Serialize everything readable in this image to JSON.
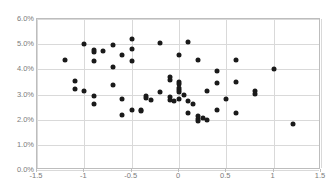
{
  "chart_data": {
    "type": "scatter",
    "title": "",
    "xlabel": "",
    "ylabel": "",
    "xlim": [
      -1.5,
      1.5
    ],
    "ylim": [
      0.0,
      6.0
    ],
    "xticks": [
      "-1.5",
      "-1",
      "-0.5",
      "0",
      "0.5",
      "1",
      "1.5"
    ],
    "xtick_values": [
      -1.5,
      -1,
      -0.5,
      0,
      0.5,
      1,
      1.5
    ],
    "yticks": [
      "0.0%",
      "1.0%",
      "2.0%",
      "3.0%",
      "4.0%",
      "5.0%",
      "6.0%"
    ],
    "ytick_values": [
      0,
      1,
      2,
      3,
      4,
      5,
      6
    ],
    "grid": true,
    "legend": false,
    "marker_color": "#1a1a1a",
    "grid_color": "#d9d9d9",
    "axis_color": "#bdbdbd",
    "tick_label_color": "#7b7b7b",
    "series": [
      {
        "name": "observations",
        "points": [
          [
            -1.2,
            4.38
          ],
          [
            -1.1,
            3.52
          ],
          [
            -1.1,
            3.2
          ],
          [
            -1.0,
            5.0
          ],
          [
            -1.0,
            3.14
          ],
          [
            -0.9,
            4.78
          ],
          [
            -0.9,
            4.7
          ],
          [
            -0.9,
            4.34
          ],
          [
            -0.9,
            2.96
          ],
          [
            -0.9,
            2.62
          ],
          [
            -0.8,
            4.72
          ],
          [
            -0.7,
            4.95
          ],
          [
            -0.7,
            4.09
          ],
          [
            -0.7,
            3.38
          ],
          [
            -0.6,
            4.55
          ],
          [
            -0.6,
            2.84
          ],
          [
            -0.6,
            2.18
          ],
          [
            -0.5,
            5.22
          ],
          [
            -0.5,
            4.8
          ],
          [
            -0.5,
            4.34
          ],
          [
            -0.5,
            2.38
          ],
          [
            -0.4,
            2.4
          ],
          [
            -0.4,
            2.33
          ],
          [
            -0.35,
            2.95
          ],
          [
            -0.35,
            2.86
          ],
          [
            -0.3,
            2.79
          ],
          [
            -0.2,
            5.06
          ],
          [
            -0.2,
            3.08
          ],
          [
            -0.1,
            3.7
          ],
          [
            -0.1,
            3.56
          ],
          [
            -0.1,
            2.92
          ],
          [
            -0.1,
            2.8
          ],
          [
            -0.05,
            2.74
          ],
          [
            0.0,
            4.57
          ],
          [
            0.0,
            3.5
          ],
          [
            0.0,
            3.4
          ],
          [
            0.0,
            3.26
          ],
          [
            0.0,
            3.18
          ],
          [
            0.0,
            3.1
          ],
          [
            0.0,
            2.81
          ],
          [
            0.05,
            3.0
          ],
          [
            0.1,
            5.1
          ],
          [
            0.1,
            2.73
          ],
          [
            0.1,
            2.26
          ],
          [
            0.15,
            2.62
          ],
          [
            0.2,
            4.36
          ],
          [
            0.2,
            2.16
          ],
          [
            0.2,
            2.02
          ],
          [
            0.2,
            1.93
          ],
          [
            0.25,
            2.05
          ],
          [
            0.3,
            3.13
          ],
          [
            0.3,
            2.0
          ],
          [
            0.4,
            3.95
          ],
          [
            0.4,
            3.44
          ],
          [
            0.4,
            2.4
          ],
          [
            0.5,
            2.81
          ],
          [
            0.6,
            4.39
          ],
          [
            0.6,
            3.48
          ],
          [
            0.6,
            2.26
          ],
          [
            0.8,
            3.12
          ],
          [
            0.8,
            3.03
          ],
          [
            1.0,
            4.02
          ],
          [
            1.2,
            1.83
          ]
        ]
      }
    ]
  },
  "header": {
    "clipped_title": ""
  }
}
